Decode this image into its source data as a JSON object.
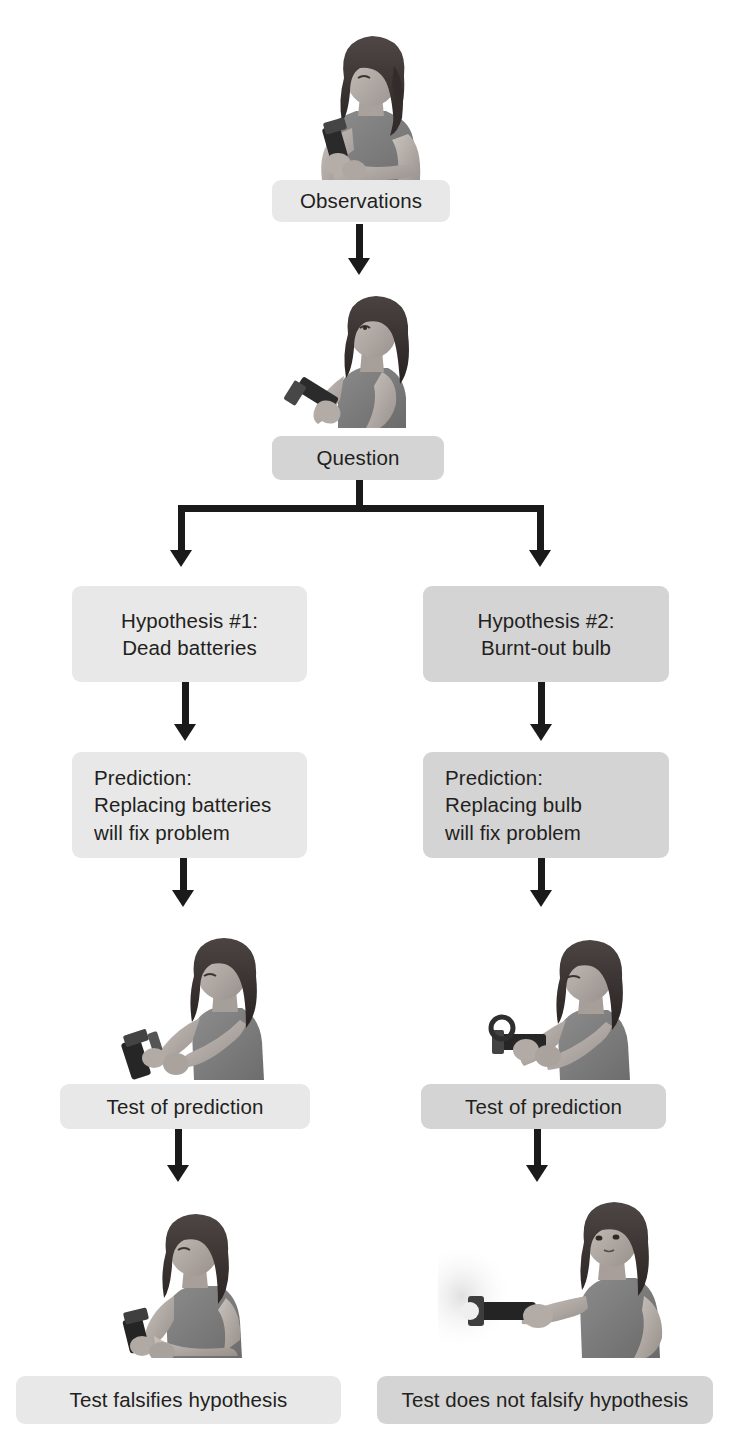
{
  "diagram": {
    "colors": {
      "box_light": "#e8e8e8",
      "box_mid": "#d4d4d4",
      "connector": "#1a1a1a",
      "text": "#231f20",
      "background": "#ffffff"
    }
  },
  "nodes": {
    "observations": {
      "label": "Observations"
    },
    "question": {
      "label": "Question"
    },
    "hypothesis_1": {
      "label": "Hypothesis #1:\nDead batteries"
    },
    "hypothesis_2": {
      "label": "Hypothesis #2:\nBurnt-out bulb"
    },
    "prediction_1": {
      "label": "Prediction:\nReplacing batteries\nwill fix problem"
    },
    "prediction_2": {
      "label": "Prediction:\nReplacing bulb\nwill fix problem"
    },
    "test_1": {
      "label": "Test of prediction"
    },
    "test_2": {
      "label": "Test of prediction"
    },
    "result_1": {
      "label": "Test falsifies hypothesis"
    },
    "result_2": {
      "label": "Test does not falsify hypothesis"
    }
  },
  "illustrations": {
    "observing": {
      "caption": "Woman looking at a flashlight that will not turn on"
    },
    "thinking": {
      "caption": "Woman holding flashlight with hand on chin, thinking"
    },
    "replacing_batteries": {
      "caption": "Woman replacing the batteries in the flashlight"
    },
    "replacing_bulb": {
      "caption": "Woman replacing the bulb of the flashlight"
    },
    "flashlight_off": {
      "caption": "Woman holding flashlight that is still not lit"
    },
    "flashlight_on": {
      "caption": "Woman holding flashlight shining a beam of light"
    }
  }
}
